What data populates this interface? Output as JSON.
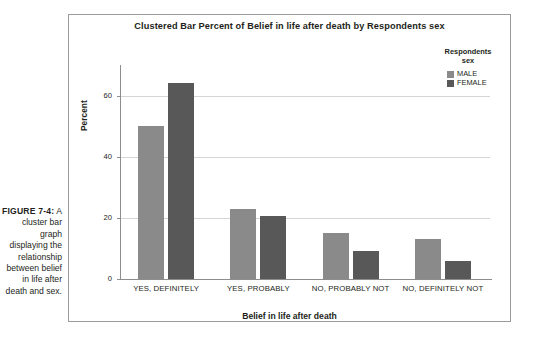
{
  "figure": {
    "label": "FIGURE 7-4:",
    "caption": "A cluster bar graph displaying the relationship between belief in life after death and sex."
  },
  "chart_data": {
    "type": "bar",
    "title": "Clustered Bar Percent of Belief in life after death by Respondents sex",
    "xlabel": "Belief in life after death",
    "ylabel": "Percent",
    "categories": [
      "YES, DEFINITELY",
      "YES, PROBABLY",
      "NO, PROBABLY NOT",
      "NO, DEFINITELY NOT"
    ],
    "series": [
      {
        "name": "MALE",
        "color": "#8a8a8a",
        "values": [
          50,
          23,
          15,
          13
        ]
      },
      {
        "name": "FEMALE",
        "color": "#585858",
        "values": [
          64,
          20.5,
          9,
          6
        ]
      }
    ],
    "ylim": [
      0,
      70
    ],
    "yticks": [
      0,
      20,
      40,
      60
    ],
    "ytick_labels": [
      "0",
      "20",
      "40",
      "60"
    ],
    "grid": true,
    "legend": {
      "title": "Respondents sex",
      "title_line1": "Respondents",
      "title_line2": "sex",
      "position": "top-right"
    }
  }
}
